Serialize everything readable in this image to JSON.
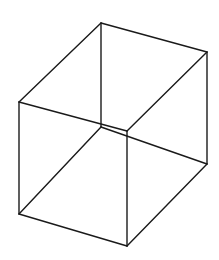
{
  "diagram": {
    "title": "",
    "type": "wireframe-cube",
    "stroke_color": "#1a1a1a",
    "background_color": "#ffffff",
    "vertices": {
      "A": [
        101,
        23
      ],
      "B": [
        207,
        52
      ],
      "C": [
        19,
        102
      ],
      "D": [
        127,
        131
      ],
      "E": [
        101,
        127
      ],
      "F": [
        207,
        164
      ],
      "G": [
        19,
        214
      ],
      "H": [
        127,
        246
      ]
    },
    "edges": [
      [
        "A",
        "B"
      ],
      [
        "A",
        "C"
      ],
      [
        "B",
        "D"
      ],
      [
        "C",
        "D"
      ],
      [
        "A",
        "E"
      ],
      [
        "B",
        "F"
      ],
      [
        "C",
        "G"
      ],
      [
        "D",
        "H"
      ],
      [
        "E",
        "F"
      ],
      [
        "E",
        "G"
      ],
      [
        "F",
        "H"
      ],
      [
        "G",
        "H"
      ]
    ]
  }
}
